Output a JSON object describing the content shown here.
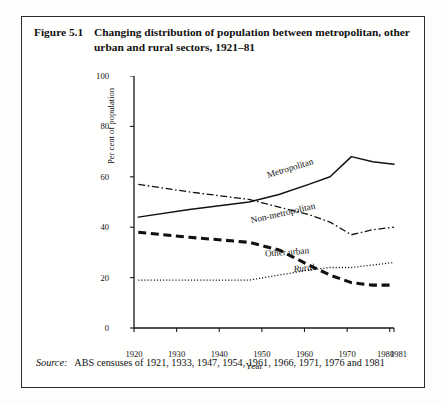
{
  "running_head": "",
  "figure": {
    "number": "Figure 5.1",
    "caption": "Changing distribution of population between metropolitan, other urban and rural sectors, 1921–81",
    "source_word": "Source:",
    "source_text": "ABS censuses of 1921, 1933, 1947, 1954, 1961, 1966, 1971, 1976 and 1981"
  },
  "chart_data": {
    "type": "line",
    "title": "Changing distribution of population between metropolitan, other urban and rural sectors, 1921–81",
    "xlabel": "Year",
    "ylabel": "Per cent of population",
    "xlim": [
      1920,
      1981
    ],
    "ylim": [
      0,
      100
    ],
    "yticks": [
      0,
      20,
      40,
      60,
      80,
      100
    ],
    "xticks": [
      1920,
      1930,
      1940,
      1950,
      1960,
      1970,
      1980,
      1981
    ],
    "xtick_labels": [
      "1920",
      "1930",
      "1940",
      "1950",
      "1960",
      "1970",
      "1980",
      "1981"
    ],
    "grid": false,
    "legend": "inline-labels",
    "x": [
      1921,
      1933,
      1947,
      1954,
      1961,
      1966,
      1971,
      1976,
      1981
    ],
    "series": [
      {
        "name": "Metropolitan",
        "style": "solid",
        "values": [
          44,
          47,
          50,
          53,
          57,
          60,
          68,
          66,
          65
        ]
      },
      {
        "name": "Non-metropolitan",
        "style": "dash-dot",
        "values": [
          57,
          54,
          51,
          48,
          45,
          42,
          37,
          39,
          40
        ]
      },
      {
        "name": "Other urban",
        "style": "dotted",
        "values": [
          19,
          19,
          19,
          21,
          23,
          24,
          24,
          25,
          26
        ]
      },
      {
        "name": "Rural",
        "style": "thick-dashed",
        "values": [
          38,
          36,
          34,
          31,
          25,
          21,
          18,
          17,
          17
        ]
      }
    ]
  }
}
